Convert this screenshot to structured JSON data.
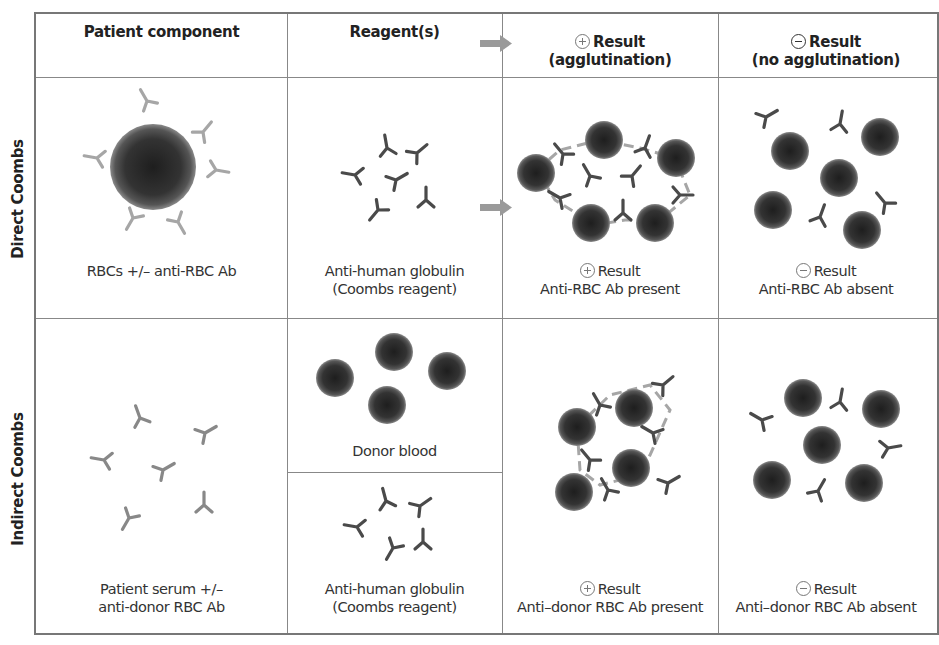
{
  "headers": {
    "col1": "Patient component",
    "col2": "Reagent(s)",
    "col3_line1": "Result",
    "col3_line2": "(agglutination)",
    "col3_symbol": "plus-circle",
    "col4_line1": "Result",
    "col4_line2": "(no agglutination)",
    "col4_symbol": "minus-circle"
  },
  "rows": [
    {
      "label": "Direct Coombs",
      "patient_component": {
        "line1": "RBCs +/– anti-RBC Ab",
        "line2": ""
      },
      "reagents": [
        {
          "line1": "Anti-human globulin",
          "line2": "(Coombs reagent)"
        }
      ],
      "positive_result": {
        "line1": "Result",
        "line2": "Anti-RBC Ab present"
      },
      "negative_result": {
        "line1": "Result",
        "line2": "Anti-RBC Ab absent"
      }
    },
    {
      "label": "Indirect Coombs",
      "patient_component": {
        "line1": "Patient serum +/–",
        "line2": "anti-donor RBC Ab"
      },
      "reagents": [
        {
          "line1": "Donor blood",
          "line2": ""
        },
        {
          "line1": "Anti-human globulin",
          "line2": "(Coombs reagent)"
        }
      ],
      "positive_result": {
        "line1": "Result",
        "line2": "Anti–donor RBC Ab present"
      },
      "negative_result": {
        "line1": "Result",
        "line2": "Anti–donor RBC Ab absent"
      }
    }
  ],
  "colors": {
    "border": "#777777",
    "rbc_dark": "#2a2a2a",
    "rbc_edge": "#6e6e6e",
    "patient_antibody": "#a9a9a9",
    "coombs_antibody": "#4a4a4a",
    "arrow": "#9a9a9a"
  }
}
